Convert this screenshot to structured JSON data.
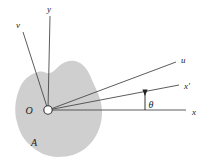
{
  "figure": {
    "background_color": "#ffffff",
    "region": {
      "name": "A",
      "label": "A",
      "fill_color": "#cccccc",
      "label_x": 34,
      "label_y": 146
    },
    "origin": {
      "label": "O",
      "label_x": 29,
      "label_y": 114,
      "point_x": 48,
      "point_y": 110,
      "marker_radius": 4.2,
      "marker_stroke": "#333333",
      "marker_fill": "#ffffff"
    },
    "angle": {
      "symbol": "θ",
      "label_x": 151,
      "label_y": 108,
      "value_deg": 12
    },
    "line_color": "#4a4a4a",
    "axes": [
      {
        "id": "y-axis",
        "label": "y",
        "label_x": 49,
        "label_y": 12,
        "x1": 48,
        "y1": 110,
        "x2": 50,
        "y2": 16
      },
      {
        "id": "v-axis",
        "label": "v",
        "label_x": 18,
        "label_y": 28,
        "x1": 48,
        "y1": 110,
        "x2": 23,
        "y2": 32
      },
      {
        "id": "u-axis",
        "label": "u",
        "label_x": 181,
        "label_y": 63,
        "x1": 48,
        "y1": 110,
        "x2": 176,
        "y2": 62
      },
      {
        "id": "x-prime-axis",
        "label": "x'",
        "label_x": 184,
        "label_y": 89,
        "x1": 48,
        "y1": 110,
        "x2": 179,
        "y2": 85
      },
      {
        "id": "x-axis",
        "label": "x",
        "label_x": 192,
        "label_y": 115,
        "x1": 48,
        "y1": 110,
        "x2": 186,
        "y2": 110
      }
    ],
    "angle_marker": {
      "id": "angle-indicator",
      "x": 145,
      "y_top": 91,
      "y_bottom": 110
    }
  }
}
